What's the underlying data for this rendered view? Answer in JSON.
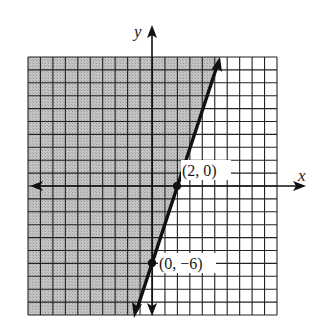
{
  "chart_data": {
    "type": "line",
    "title": "",
    "subtitle": "",
    "xlabel": "x",
    "ylabel": "y",
    "xlim": [
      -10,
      10
    ],
    "ylim": [
      -10,
      10
    ],
    "grid": true,
    "grid_step": 1,
    "legend": null,
    "series": [
      {
        "name": "boundary line",
        "equation": "y = 3x - 6",
        "style": "solid",
        "points": [
          [
            0,
            -6
          ],
          [
            2,
            0
          ]
        ]
      }
    ],
    "shaded_region": {
      "inequality": "y >= 3x - 6",
      "side": "left/above the line",
      "fill": "#bdbdbd"
    },
    "annotations": [
      {
        "text": "(2, 0)",
        "x": 2,
        "y": 0
      },
      {
        "text": "(0, −6)",
        "x": 0,
        "y": -6
      }
    ]
  },
  "labels": {
    "x_axis": "x",
    "y_axis": "y",
    "point_a": "(2, 0)",
    "point_b": "(0, −6)"
  },
  "colors": {
    "shade": "#bdbdbd",
    "grid": "#222222",
    "line": "#111111",
    "background": "#ffffff"
  }
}
